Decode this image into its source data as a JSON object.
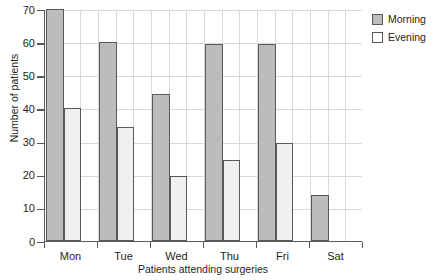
{
  "chart_data": {
    "type": "bar",
    "title": "",
    "xlabel": "Patients attending surgeries",
    "ylabel": "Number of patients",
    "categories": [
      "Mon",
      "Tue",
      "Wed",
      "Thu",
      "Fri",
      "Sat"
    ],
    "series": [
      {
        "name": "Morning",
        "color": "#bcbcbc",
        "values": [
          70,
          60,
          44.5,
          59.5,
          59.5,
          14
        ]
      },
      {
        "name": "Evening",
        "color": "#f0f0f0",
        "values": [
          40,
          34.5,
          19.5,
          24.5,
          29.5,
          0
        ]
      }
    ],
    "ylim": [
      0,
      70
    ],
    "yticks": [
      0,
      10,
      20,
      30,
      40,
      50,
      60,
      70
    ],
    "ytick_labels": [
      "0",
      "10",
      "20",
      "30",
      "40",
      "50",
      "60",
      "70"
    ],
    "grid": true,
    "legend_position": "right-top"
  },
  "legend": {
    "items": [
      {
        "label": "Morning",
        "swatch": "morning"
      },
      {
        "label": "Evening",
        "swatch": "evening"
      }
    ]
  }
}
